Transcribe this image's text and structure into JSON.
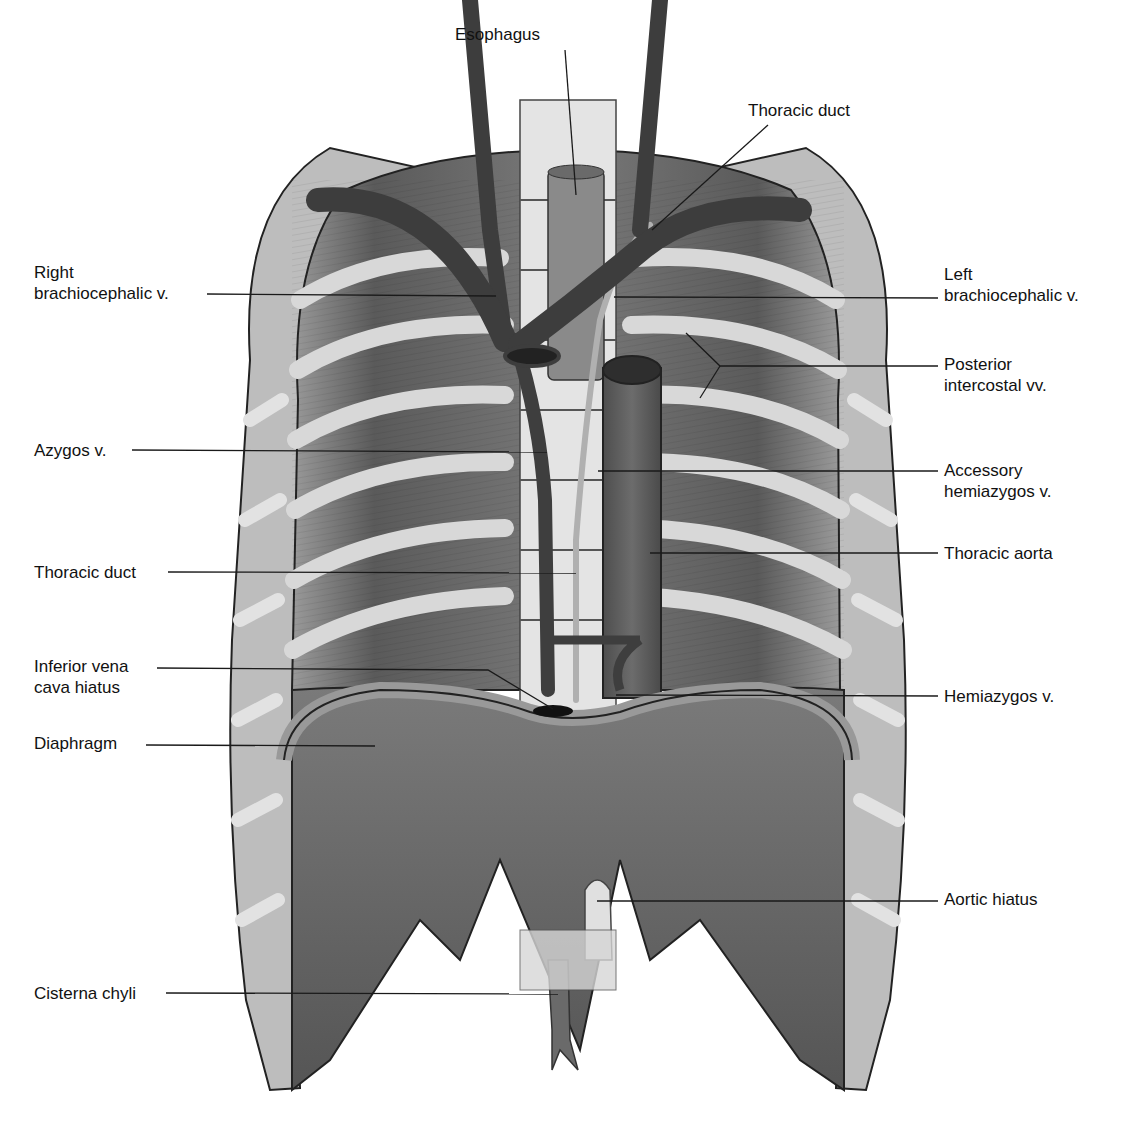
{
  "figure": {
    "type": "anatomical illustration",
    "colors": {
      "background": "#ffffff",
      "vein": "#4a4a4a",
      "muscle": "#6e6e6e",
      "rib": "#d4d4d4",
      "vertebra": "#e6e6e6",
      "aorta": "#5e5e5e",
      "outline": "#222222",
      "leader": "#1a1a1a",
      "text": "#111111"
    }
  },
  "labels": [
    {
      "id": "esophagus",
      "lines": [
        "Esophagus"
      ],
      "x": 455,
      "y": 24,
      "align": "left",
      "leader": [
        [
          565,
          50
        ],
        [
          576,
          195
        ]
      ]
    },
    {
      "id": "thoracic-duct-top",
      "lines": [
        "Thoracic duct"
      ],
      "x": 748,
      "y": 100,
      "align": "left",
      "leader": [
        [
          768,
          125
        ],
        [
          652,
          230
        ]
      ]
    },
    {
      "id": "right-brachiocephalic-v",
      "lines": [
        "Right",
        "brachiocephalic v."
      ],
      "x": 34,
      "y": 262,
      "align": "left",
      "leader": [
        [
          207,
          294
        ],
        [
          496,
          296
        ]
      ]
    },
    {
      "id": "left-brachiocephalic-v",
      "lines": [
        "Left",
        "brachiocephalic v."
      ],
      "x": 944,
      "y": 264,
      "align": "left",
      "leader": [
        [
          938,
          298
        ],
        [
          614,
          297
        ]
      ]
    },
    {
      "id": "posterior-intercostal-vv",
      "lines": [
        "Posterior",
        "intercostal vv."
      ],
      "x": 944,
      "y": 354,
      "align": "left",
      "leader": [
        [
          938,
          366
        ],
        [
          720,
          366
        ],
        [
          686,
          333
        ]
      ],
      "leader_branch": [
        [
          720,
          366
        ],
        [
          700,
          398
        ]
      ]
    },
    {
      "id": "azygos-v",
      "lines": [
        "Azygos v."
      ],
      "x": 34,
      "y": 440,
      "align": "left",
      "leader": [
        [
          132,
          450
        ],
        [
          547,
          452
        ]
      ]
    },
    {
      "id": "accessory-hemiazygos-v",
      "lines": [
        "Accessory",
        "hemiazygos v."
      ],
      "x": 944,
      "y": 460,
      "align": "left",
      "leader": [
        [
          938,
          471
        ],
        [
          598,
          471
        ]
      ]
    },
    {
      "id": "thoracic-aorta",
      "lines": [
        "Thoracic aorta"
      ],
      "x": 944,
      "y": 543,
      "align": "left",
      "leader": [
        [
          938,
          553
        ],
        [
          650,
          553
        ]
      ]
    },
    {
      "id": "thoracic-duct",
      "lines": [
        "Thoracic duct"
      ],
      "x": 34,
      "y": 562,
      "align": "left",
      "leader": [
        [
          168,
          572
        ],
        [
          576,
          573
        ]
      ]
    },
    {
      "id": "inferior-vena-cava-hiatus",
      "lines": [
        "Inferior vena",
        "cava hiatus"
      ],
      "x": 34,
      "y": 656,
      "align": "left",
      "leader": [
        [
          157,
          668
        ],
        [
          488,
          670
        ],
        [
          553,
          709
        ]
      ]
    },
    {
      "id": "hemiazygos-v",
      "lines": [
        "Hemiazygos v."
      ],
      "x": 944,
      "y": 686,
      "align": "left",
      "leader": [
        [
          938,
          696
        ],
        [
          616,
          695
        ]
      ]
    },
    {
      "id": "diaphragm",
      "lines": [
        "Diaphragm"
      ],
      "x": 34,
      "y": 733,
      "align": "left",
      "leader": [
        [
          146,
          745
        ],
        [
          375,
          746
        ]
      ]
    },
    {
      "id": "aortic-hiatus",
      "lines": [
        "Aortic hiatus"
      ],
      "x": 944,
      "y": 889,
      "align": "left",
      "leader": [
        [
          938,
          901
        ],
        [
          597,
          901
        ]
      ]
    },
    {
      "id": "cisterna-chyli",
      "lines": [
        "Cisterna chyli"
      ],
      "x": 34,
      "y": 983,
      "align": "left",
      "leader": [
        [
          166,
          993
        ],
        [
          558,
          994
        ]
      ]
    }
  ]
}
